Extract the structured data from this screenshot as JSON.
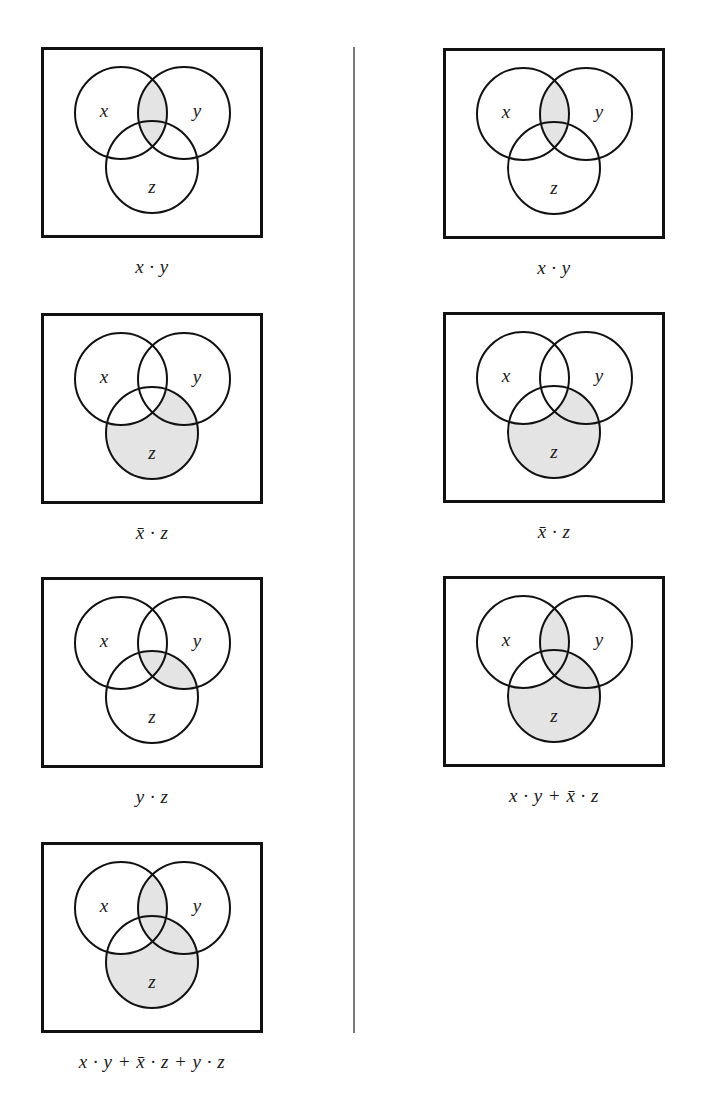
{
  "figure": {
    "type": "venn-diagram-panels",
    "sets": [
      "x",
      "y",
      "z"
    ],
    "colors": {
      "shade": "#e4e4e4",
      "stroke": "#111111",
      "divider": "#7a7a7a",
      "background": "#ffffff"
    },
    "circle_labels": {
      "x": "x",
      "y": "y",
      "z": "z"
    },
    "columns": [
      {
        "name": "left",
        "panels": [
          {
            "caption": "x · y",
            "shaded_regions": [
              "x∩y"
            ]
          },
          {
            "caption": "x̄ · z",
            "shaded_regions": [
              "z∖x"
            ]
          },
          {
            "caption": "y · z",
            "shaded_regions": [
              "y∩z"
            ]
          },
          {
            "caption": "x · y + x̄ · z + y · z",
            "shaded_regions": [
              "x∩y",
              "z∖x",
              "y∩z"
            ]
          }
        ]
      },
      {
        "name": "right",
        "panels": [
          {
            "caption": "x · y",
            "shaded_regions": [
              "x∩y"
            ]
          },
          {
            "caption": "x̄ · z",
            "shaded_regions": [
              "z∖x"
            ]
          },
          {
            "caption": "x · y + x̄ · z",
            "shaded_regions": [
              "x∩y",
              "z∖x"
            ]
          }
        ]
      }
    ]
  }
}
